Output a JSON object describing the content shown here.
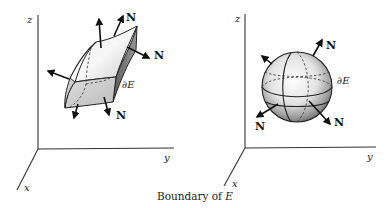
{
  "caption": {
    "prefix": "Boundary of ",
    "variable": "E"
  },
  "figures": [
    {
      "id": "left",
      "shape": "curved-box-surface",
      "axes": {
        "x": "x",
        "y": "y",
        "z": "z"
      },
      "boundary_label": "∂E",
      "normal_label": "N",
      "normal_labels_count": 3,
      "unlabeled_normals": 2
    },
    {
      "id": "right",
      "shape": "sphere",
      "axes": {
        "x": "x",
        "y": "y",
        "z": "z"
      },
      "boundary_label": "∂E",
      "normal_label": "N",
      "normal_labels_count": 3,
      "unlabeled_normals": 1
    }
  ],
  "colors": {
    "ink": "#222222",
    "background": "#ffffff"
  }
}
